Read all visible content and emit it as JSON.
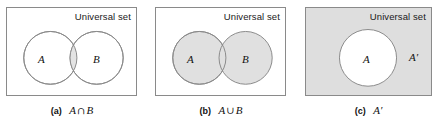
{
  "figure": {
    "name": "venn-diagram-set-operations",
    "panels": [
      {
        "tag": "(a)",
        "universal_label": "Universal set",
        "sets": [
          {
            "label": "A"
          },
          {
            "label": "B"
          }
        ],
        "expression": {
          "left": "A",
          "operator": "∩",
          "right": "B"
        },
        "shaded_region": "intersection",
        "circle_fill": "#ffffff",
        "shade_fill": "#e3e3e3",
        "box_fill": "#ffffff",
        "stroke": "#8a8a8a"
      },
      {
        "tag": "(b)",
        "universal_label": "Universal set",
        "sets": [
          {
            "label": "A"
          },
          {
            "label": "B"
          }
        ],
        "expression": {
          "left": "A",
          "operator": "∪",
          "right": "B"
        },
        "shaded_region": "union",
        "circle_fill": "#e0e0e0",
        "shade_fill": "#e0e0e0",
        "box_fill": "#ffffff",
        "stroke": "#8a8a8a"
      },
      {
        "tag": "(c)",
        "universal_label": "Universal set",
        "sets": [
          {
            "label": "A"
          },
          {
            "label": "A′"
          }
        ],
        "expression": {
          "left": "A′",
          "operator": "",
          "right": ""
        },
        "shaded_region": "complement",
        "circle_fill": "#ffffff",
        "shade_fill": "#dedede",
        "box_fill": "#dedede",
        "stroke": "#8a8a8a"
      }
    ]
  }
}
